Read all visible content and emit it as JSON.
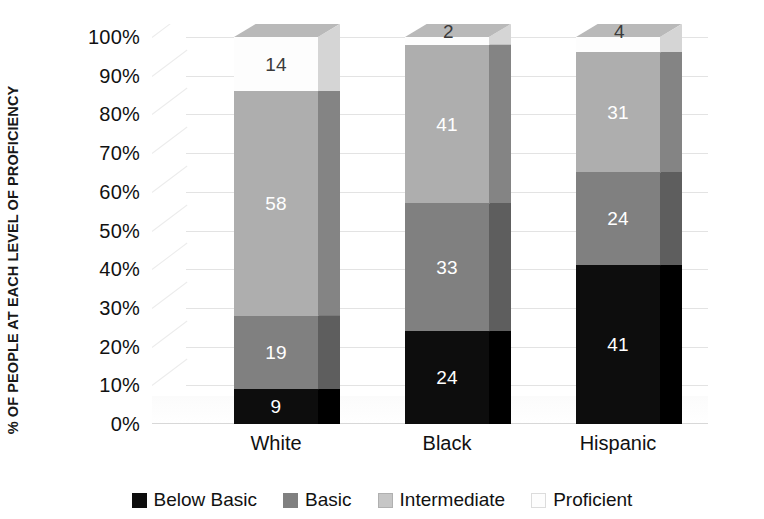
{
  "chart_data": {
    "type": "bar",
    "subtype": "stacked-column-3d",
    "title": "",
    "xlabel": "",
    "ylabel": "% OF PEOPLE AT EACH LEVEL OF PROFICIENCY",
    "categories": [
      "White",
      "Black",
      "Hispanic"
    ],
    "series": [
      {
        "name": "Below Basic",
        "values": [
          9,
          24,
          41
        ],
        "color": "#0d0d0d"
      },
      {
        "name": "Basic",
        "values": [
          19,
          33,
          24
        ],
        "color": "#808080"
      },
      {
        "name": "Intermediate",
        "values": [
          58,
          41,
          31
        ],
        "color": "#aeaeae"
      },
      {
        "name": "Proficient",
        "values": [
          14,
          2,
          4
        ],
        "color": "#fdfdfd"
      }
    ],
    "ylim": [
      0,
      100
    ],
    "ytick_labels": [
      "0%",
      "10%",
      "20%",
      "30%",
      "40%",
      "50%",
      "60%",
      "70%",
      "80%",
      "90%",
      "100%"
    ],
    "ytick_values": [
      0,
      10,
      20,
      30,
      40,
      50,
      60,
      70,
      80,
      90,
      100
    ],
    "grid": true,
    "grid_axis": "y",
    "legend_position": "bottom",
    "stack_total": 100,
    "value_label_colors": {
      "Below Basic": "light",
      "Basic": "light",
      "Intermediate": "light",
      "Proficient": "dark"
    },
    "side_face_colors": {
      "Below Basic": "#000000",
      "Basic": "#5e5e5e",
      "Intermediate": "#848484",
      "Proficient": "#d5d5d5"
    },
    "top_face_colors": {
      "Below Basic": "#3d3d3d",
      "Basic": "#9a9a9a",
      "Intermediate": "#c2c2c2",
      "Proficient": "#b9b9b9"
    }
  },
  "legend": {
    "items": [
      {
        "label": "Below Basic",
        "color": "#0d0d0d",
        "border": "#0d0d0d"
      },
      {
        "label": "Basic",
        "color": "#808080",
        "border": "#808080"
      },
      {
        "label": "Intermediate",
        "color": "#c6c6c6",
        "border": "#b0b0b0"
      },
      {
        "label": "Proficient",
        "color": "#fdfdfd",
        "border": "#dcdcdc"
      }
    ]
  }
}
